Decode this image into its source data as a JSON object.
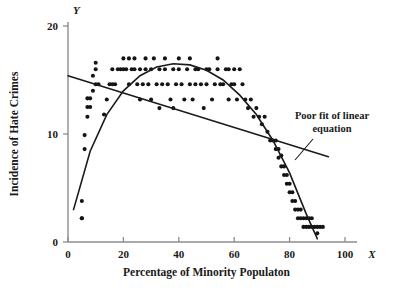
{
  "chart_data": {
    "type": "scatter",
    "title": "",
    "xlabel": "Percentage of Minority Populaton",
    "ylabel": "Incidence of Hate Crimes",
    "x_axis_letter": "X",
    "y_axis_letter": "Y",
    "xlim": [
      0,
      100
    ],
    "ylim": [
      0,
      20
    ],
    "xticks": [
      0,
      20,
      40,
      60,
      80,
      100
    ],
    "yticks": [
      0,
      10,
      20
    ],
    "xtick_labels": [
      "0",
      "20",
      "40",
      "60",
      "80",
      "100"
    ],
    "ytick_labels": [
      "0",
      "10",
      "20"
    ],
    "grid": false,
    "legend": "none",
    "point_color": "#141414",
    "line_color": "#1a1a1a",
    "axis_color": "#8c8c8c",
    "annotations": [
      {
        "name": "poor-fit-annotation",
        "line1": "Poor fit of linear",
        "line2": "equation",
        "points_to": "linear-regression-line"
      }
    ],
    "series": [
      {
        "name": "linear-regression-line",
        "type": "line",
        "description": "Poor fit of linear equation",
        "x": [
          0,
          94
        ],
        "y": [
          15.4,
          7.9
        ]
      },
      {
        "name": "quadratic-curve",
        "type": "line",
        "description": "Curvilinear fit following the data",
        "x": [
          2,
          8,
          14,
          20,
          26,
          32,
          38,
          44,
          50,
          56,
          62,
          68,
          74,
          80,
          86,
          90
        ],
        "y": [
          3.0,
          8.4,
          11.8,
          14.0,
          15.4,
          16.2,
          16.5,
          16.4,
          15.9,
          15.0,
          13.6,
          11.8,
          9.4,
          6.4,
          2.6,
          0.3
        ]
      },
      {
        "name": "scatter-points",
        "type": "scatter",
        "x": [
          5,
          5,
          5,
          6,
          6,
          7,
          7,
          7,
          8,
          8,
          9,
          9,
          10,
          10,
          10,
          11,
          13,
          14,
          15,
          16,
          16,
          17,
          18,
          19,
          20,
          20,
          21,
          22,
          22,
          23,
          24,
          24,
          25,
          26,
          26,
          27,
          28,
          28,
          29,
          30,
          30,
          31,
          32,
          33,
          33,
          34,
          35,
          35,
          36,
          37,
          38,
          38,
          39,
          40,
          40,
          41,
          42,
          43,
          44,
          44,
          45,
          46,
          46,
          47,
          48,
          49,
          50,
          50,
          51,
          52,
          53,
          54,
          54,
          55,
          56,
          57,
          58,
          58,
          59,
          60,
          60,
          61,
          62,
          63,
          64,
          65,
          66,
          67,
          68,
          69,
          70,
          71,
          72,
          73,
          74,
          75,
          75,
          76,
          76,
          77,
          77,
          78,
          78,
          79,
          79,
          80,
          80,
          81,
          81,
          82,
          82,
          83,
          83,
          84,
          84,
          85,
          85,
          86,
          86,
          87,
          87,
          88,
          88,
          89,
          90,
          90,
          91,
          92
        ],
        "y": [
          2.2,
          2.2,
          3.8,
          8.6,
          9.9,
          11.6,
          12.5,
          13.3,
          12.5,
          13.3,
          14.0,
          15.4,
          14.6,
          16.0,
          16.6,
          14.6,
          11.8,
          13.2,
          14.6,
          14.6,
          16.0,
          14.6,
          16.0,
          16.0,
          16.0,
          17.0,
          16.0,
          14.6,
          17.0,
          16.0,
          16.0,
          17.0,
          14.6,
          13.2,
          16.0,
          14.6,
          16.0,
          17.0,
          14.6,
          13.2,
          16.0,
          17.0,
          14.6,
          12.4,
          16.0,
          14.6,
          16.0,
          17.0,
          14.6,
          13.2,
          12.4,
          16.0,
          14.6,
          16.0,
          17.0,
          14.6,
          13.2,
          16.0,
          14.6,
          17.0,
          13.2,
          14.6,
          16.0,
          16.0,
          14.6,
          12.4,
          14.6,
          16.0,
          16.0,
          13.2,
          14.6,
          16.0,
          17.0,
          14.6,
          14.6,
          16.0,
          13.2,
          16.0,
          14.6,
          14.6,
          16.0,
          13.2,
          16.0,
          14.6,
          13.2,
          12.4,
          13.2,
          11.6,
          12.4,
          11.6,
          10.9,
          11.6,
          10.2,
          9.4,
          9.4,
          8.6,
          9.4,
          8.6,
          7.8,
          8.0,
          7.0,
          6.2,
          7.0,
          5.4,
          6.2,
          4.6,
          5.4,
          3.8,
          4.6,
          3.0,
          3.8,
          2.2,
          3.0,
          2.2,
          3.0,
          1.4,
          2.2,
          1.4,
          2.2,
          1.4,
          2.2,
          1.4,
          2.2,
          1.4,
          0.8,
          1.4,
          1.4,
          1.4
        ]
      }
    ]
  }
}
